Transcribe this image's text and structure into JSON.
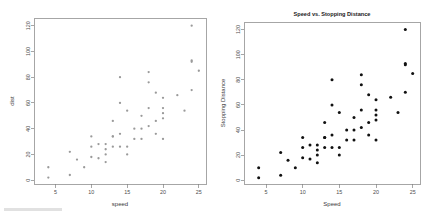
{
  "figure": {
    "background": "#ffffff",
    "width": 432,
    "height": 214,
    "panel_count": 2
  },
  "chart_data": [
    {
      "id": "left-plot",
      "type": "scatter",
      "title": "",
      "xlabel": "speed",
      "ylabel": "dist",
      "xlim": [
        2,
        26
      ],
      "ylim": [
        -3,
        126
      ],
      "xticks": [
        5,
        10,
        15,
        20,
        25
      ],
      "yticks": [
        0,
        20,
        40,
        60,
        80,
        100,
        120
      ],
      "grid": false,
      "legend": false,
      "marker": "open-circle",
      "marker_color": "#9a9a9a",
      "frame": "box",
      "x": [
        4,
        4,
        7,
        7,
        8,
        9,
        10,
        10,
        10,
        11,
        11,
        12,
        12,
        12,
        12,
        13,
        13,
        13,
        13,
        14,
        14,
        14,
        14,
        15,
        15,
        15,
        16,
        16,
        17,
        17,
        17,
        18,
        18,
        18,
        18,
        19,
        19,
        19,
        20,
        20,
        20,
        20,
        20,
        22,
        23,
        24,
        24,
        24,
        24,
        25
      ],
      "y": [
        2,
        10,
        4,
        22,
        16,
        10,
        18,
        26,
        34,
        17,
        28,
        14,
        20,
        24,
        28,
        26,
        34,
        34,
        46,
        26,
        36,
        60,
        80,
        20,
        26,
        54,
        32,
        40,
        32,
        40,
        50,
        42,
        56,
        76,
        84,
        36,
        46,
        68,
        32,
        48,
        52,
        56,
        64,
        66,
        54,
        70,
        92,
        93,
        120,
        85
      ]
    },
    {
      "id": "right-plot",
      "type": "scatter",
      "title": "Speed vs. Stopping Distance",
      "xlabel": "Speed",
      "ylabel": "Stopping Distance",
      "xlim": [
        2,
        26
      ],
      "ylim": [
        -3,
        126
      ],
      "xticks": [
        5,
        10,
        15,
        20,
        25
      ],
      "yticks": [
        0,
        20,
        40,
        60,
        80,
        100,
        120
      ],
      "grid": false,
      "legend": false,
      "marker": "filled-circle",
      "marker_color": "#111111",
      "frame": "box",
      "x": [
        4,
        4,
        7,
        7,
        8,
        9,
        10,
        10,
        10,
        11,
        11,
        12,
        12,
        12,
        12,
        13,
        13,
        13,
        13,
        14,
        14,
        14,
        14,
        15,
        15,
        15,
        16,
        16,
        17,
        17,
        17,
        18,
        18,
        18,
        18,
        19,
        19,
        19,
        20,
        20,
        20,
        20,
        20,
        22,
        23,
        24,
        24,
        24,
        24,
        25
      ],
      "y": [
        2,
        10,
        4,
        22,
        16,
        10,
        18,
        26,
        34,
        17,
        28,
        14,
        20,
        24,
        28,
        26,
        34,
        34,
        46,
        26,
        36,
        60,
        80,
        20,
        26,
        54,
        32,
        40,
        32,
        40,
        50,
        42,
        56,
        76,
        84,
        36,
        46,
        68,
        32,
        48,
        52,
        56,
        64,
        66,
        54,
        70,
        92,
        93,
        120,
        85
      ]
    }
  ]
}
